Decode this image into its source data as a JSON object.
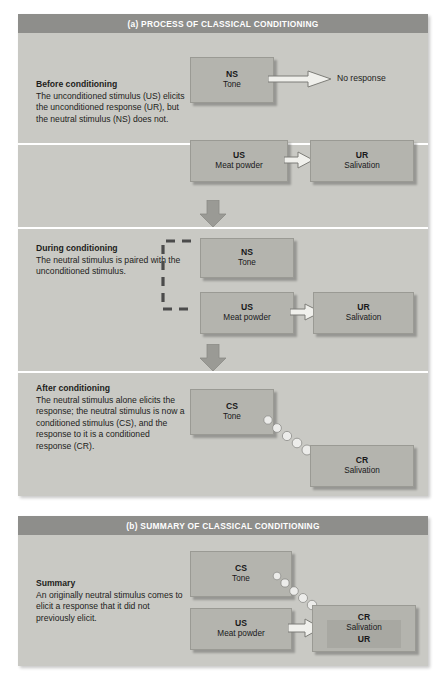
{
  "figure": {
    "panel_a_title": "(a) PROCESS OF CLASSICAL CONDITIONING",
    "panel_b_title": "(b) SUMMARY OF CLASSICAL CONDITIONING"
  },
  "colors": {
    "panel_bg": "#c9c9c4",
    "header_bg": "#8e8e8b",
    "box_bg": "#b4b4ae",
    "box_border": "#9a9a94",
    "arrow_fill": "#f0f0ec",
    "arrow_stroke": "#7d7d78",
    "text": "#1d1d1b",
    "divider": "#ffffff"
  },
  "stages": [
    {
      "id": "before",
      "title": "Before conditioning",
      "body": "The unconditioned stimulus (US)  elicits the unconditioned response (UR), but the neutral stimulus (NS) does not.",
      "boxes": [
        {
          "id": "ns",
          "code": "NS",
          "label": "Tone"
        },
        {
          "id": "us",
          "code": "US",
          "label": "Meat powder"
        },
        {
          "id": "ur",
          "code": "UR",
          "label": "Salivation"
        }
      ],
      "no_response_label": "No response"
    },
    {
      "id": "during",
      "title": "During conditioning",
      "body": "The neutral stimulus is paired with the unconditioned stimulus.",
      "boxes": [
        {
          "id": "ns",
          "code": "NS",
          "label": "Tone"
        },
        {
          "id": "us",
          "code": "US",
          "label": "Meat powder"
        },
        {
          "id": "ur",
          "code": "UR",
          "label": "Salivation"
        }
      ]
    },
    {
      "id": "after",
      "title": "After conditioning",
      "body": "The neutral stimulus alone elicits the response; the neutral stimulus is now a conditioned stimulus (CS), and the response to it is a conditioned response (CR).",
      "boxes": [
        {
          "id": "cs",
          "code": "CS",
          "label": "Tone"
        },
        {
          "id": "cr",
          "code": "CR",
          "label": "Salivation"
        }
      ]
    },
    {
      "id": "summary",
      "title": "Summary",
      "body": "An originally neutral stimulus comes to elicit a response that it did not previously elicit.",
      "boxes": [
        {
          "id": "cs",
          "code": "CS",
          "label": "Tone"
        },
        {
          "id": "us",
          "code": "US",
          "label": "Meat powder"
        },
        {
          "id": "cr",
          "code": "CR",
          "label": "Salivation",
          "label2": "UR"
        }
      ]
    }
  ],
  "icons": {
    "down_arrow": "down-arrow-icon",
    "block_arrow": "block-arrow-icon",
    "dotted_arrow": "dotted-curved-arrow-icon",
    "pairing_bracket": "dashed-pairing-bracket-icon"
  }
}
